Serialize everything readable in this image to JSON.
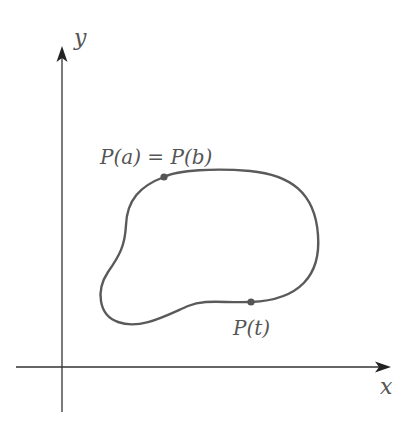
{
  "figure": {
    "type": "parametric closed curve diagram",
    "axes": {
      "x_label": "x",
      "y_label": "y"
    },
    "curve": {
      "description": "simple closed curve in the first quadrant",
      "color": "#5a5a5a",
      "points": [
        {
          "name": "start-end-point",
          "label": "P(a) = P(b)"
        },
        {
          "name": "moving-point",
          "label": "P(t)"
        }
      ]
    },
    "colors": {
      "axis": "#333333",
      "curve": "#5a5a5a",
      "point": "#555555",
      "label": "#555555"
    }
  }
}
